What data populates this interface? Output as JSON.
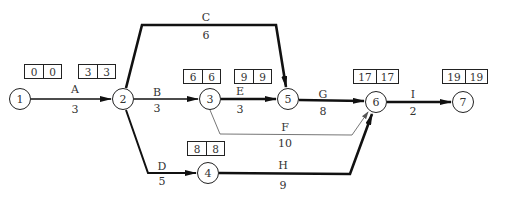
{
  "diagram": {
    "type": "activity-on-arrow network",
    "nodes": [
      {
        "id": "1",
        "label": "1",
        "x": 20,
        "y": 99,
        "times": [
          "0",
          "0"
        ],
        "box": {
          "x": 24,
          "y": 64,
          "wide": false
        }
      },
      {
        "id": "2",
        "label": "2",
        "x": 123,
        "y": 99,
        "times": [
          "3",
          "3"
        ],
        "box": {
          "x": 78,
          "y": 64,
          "wide": false
        }
      },
      {
        "id": "3",
        "label": "3",
        "x": 210,
        "y": 99,
        "times": [
          "6",
          "6"
        ],
        "box": {
          "x": 183,
          "y": 69,
          "wide": false
        }
      },
      {
        "id": "4",
        "label": "4",
        "x": 208,
        "y": 173,
        "times": [
          "8",
          "8"
        ],
        "box": {
          "x": 187,
          "y": 141,
          "wide": false
        }
      },
      {
        "id": "5",
        "label": "5",
        "x": 288,
        "y": 99,
        "times": [
          "9",
          "9"
        ],
        "box": {
          "x": 234,
          "y": 69,
          "wide": false
        }
      },
      {
        "id": "6",
        "label": "6",
        "x": 376,
        "y": 102,
        "times": [
          "17",
          "17"
        ],
        "box": {
          "x": 353,
          "y": 69,
          "wide": true
        }
      },
      {
        "id": "7",
        "label": "7",
        "x": 463,
        "y": 102,
        "times": [
          "19",
          "19"
        ],
        "box": {
          "x": 442,
          "y": 69,
          "wide": true
        }
      }
    ],
    "activities": [
      {
        "name": "A",
        "duration": "3",
        "from": "1",
        "to": "2",
        "critical": true,
        "name_pos": [
          75,
          89
        ],
        "dur_pos": [
          75,
          109
        ]
      },
      {
        "name": "B",
        "duration": "3",
        "from": "2",
        "to": "3",
        "critical": true,
        "name_pos": [
          157,
          92
        ],
        "dur_pos": [
          157,
          108
        ]
      },
      {
        "name": "C",
        "duration": "6",
        "from": "2",
        "to": "5",
        "critical": true,
        "name_pos": [
          206,
          17
        ],
        "dur_pos": [
          206,
          35
        ]
      },
      {
        "name": "D",
        "duration": "5",
        "from": "2",
        "to": "4",
        "critical": false,
        "name_pos": [
          162,
          166
        ],
        "dur_pos": [
          162,
          181
        ]
      },
      {
        "name": "E",
        "duration": "3",
        "from": "3",
        "to": "5",
        "critical": true,
        "name_pos": [
          240,
          91
        ],
        "dur_pos": [
          240,
          109
        ]
      },
      {
        "name": "F",
        "duration": "10",
        "from": "3",
        "to": "6",
        "critical": false,
        "name_pos": [
          285,
          127
        ],
        "dur_pos": [
          285,
          143
        ]
      },
      {
        "name": "G",
        "duration": "8",
        "from": "5",
        "to": "6",
        "critical": true,
        "name_pos": [
          323,
          94
        ],
        "dur_pos": [
          323,
          111
        ]
      },
      {
        "name": "H",
        "duration": "9",
        "from": "4",
        "to": "6",
        "critical": true,
        "name_pos": [
          283,
          165
        ],
        "dur_pos": [
          283,
          185
        ]
      },
      {
        "name": "I",
        "duration": "2",
        "from": "6",
        "to": "7",
        "critical": true,
        "name_pos": [
          413,
          94
        ],
        "dur_pos": [
          413,
          111
        ]
      }
    ]
  },
  "colors": {
    "line": "#111111",
    "thin_line": "#777777",
    "text": "#333333"
  }
}
